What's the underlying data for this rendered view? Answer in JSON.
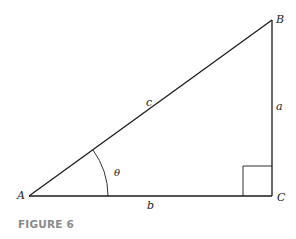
{
  "figure": {
    "caption": "FIGURE 6",
    "caption_color": "#8a8a8a",
    "line_color": "#1a1a1a",
    "vertices": {
      "A": {
        "label": "A",
        "x": 29,
        "y": 196
      },
      "B": {
        "label": "B",
        "x": 272,
        "y": 20
      },
      "C": {
        "label": "C",
        "x": 272,
        "y": 196
      }
    },
    "sides": {
      "hypotenuse": {
        "label": "c",
        "from": "A",
        "to": "B"
      },
      "opposite": {
        "label": "a",
        "from": "B",
        "to": "C"
      },
      "adjacent": {
        "label": "b",
        "from": "A",
        "to": "C"
      }
    },
    "angle": {
      "label": "θ",
      "vertex": "A",
      "arc_radius": 79
    },
    "right_angle_marker": {
      "vertex": "C",
      "size": 29
    }
  }
}
